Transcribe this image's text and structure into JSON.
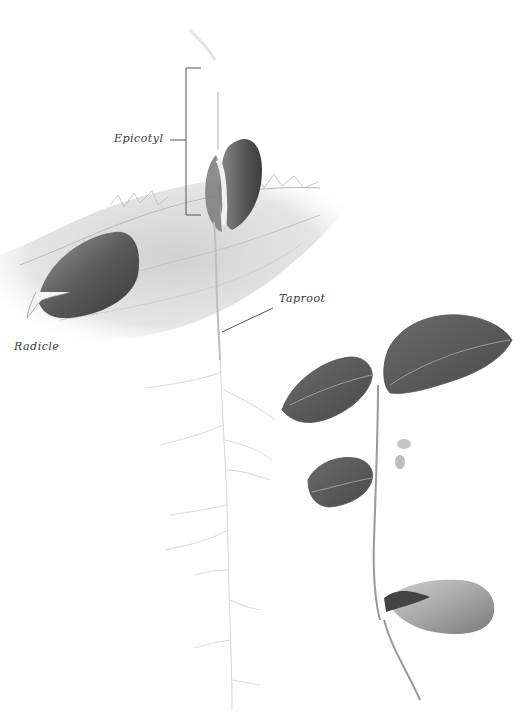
{
  "illustration": {
    "subject": "Oak acorn germination stages (pencil botanical drawing)",
    "labels": {
      "epicotyl": "Epicotyl",
      "radicle": "Radicle",
      "taproot": "Taproot"
    },
    "colors": {
      "background": "#ffffff",
      "pencil_dark": "#4a4a4a",
      "pencil_mid": "#8a8a8a",
      "pencil_light": "#c8c8c8",
      "label_text": "#3a3a3a"
    }
  }
}
